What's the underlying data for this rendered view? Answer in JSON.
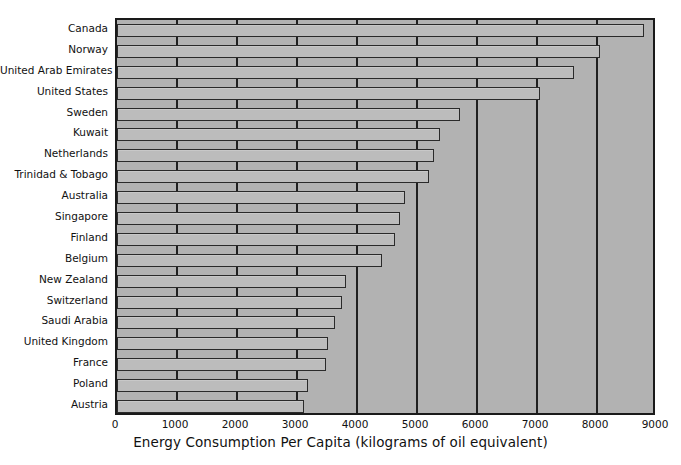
{
  "chart_data": {
    "type": "bar",
    "orientation": "horizontal",
    "title": "",
    "xlabel": "Energy Consumption Per Capita (kilograms of oil equivalent)",
    "ylabel": "",
    "xlim": [
      0,
      9000
    ],
    "ylim": null,
    "grid": true,
    "legend": null,
    "xticks": [
      "0",
      "1000",
      "2000",
      "3000",
      "4000",
      "5000",
      "6000",
      "7000",
      "8000",
      "9000"
    ],
    "xtick_values": [
      0,
      1000,
      2000,
      3000,
      4000,
      5000,
      6000,
      7000,
      8000,
      9000
    ],
    "categories": [
      "Canada",
      "Norway",
      "United Arab Emirates",
      "United States",
      "Sweden",
      "Kuwait",
      "Netherlands",
      "Trinidad & Tobago",
      "Australia",
      "Singapore",
      "Finland",
      "Belgium",
      "New Zealand",
      "Switzerland",
      "Saudi Arabia",
      "United Kingdom",
      "France",
      "Poland",
      "Austria"
    ],
    "values": [
      8780,
      8050,
      7620,
      7050,
      5720,
      5380,
      5280,
      5200,
      4800,
      4720,
      4630,
      4420,
      3820,
      3750,
      3630,
      3520,
      3480,
      3180,
      3120
    ],
    "colors": {
      "plot_background": "#b2b2b2",
      "bar_fill": "#bcbcbc",
      "bar_border": "#2a2a2a",
      "gridline": "#202020",
      "axis": "#1a1a1a",
      "text": "#111111",
      "page_background": "#ffffff"
    }
  }
}
